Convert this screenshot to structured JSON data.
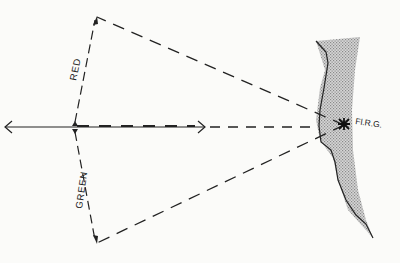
{
  "diagram": {
    "type": "sector-light-diagram",
    "labels": {
      "red_sector": "RED",
      "green_sector": "GREEN",
      "light_characteristic": "Fl.R.G."
    },
    "colors": {
      "ink": "#222222",
      "land_fill": "#c9c9c9",
      "background": "#fbfbf9"
    }
  }
}
